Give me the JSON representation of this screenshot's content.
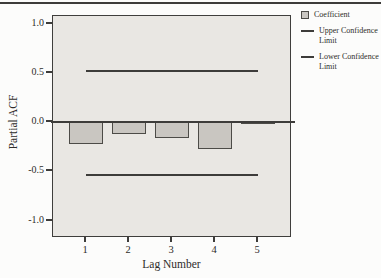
{
  "chart_data": {
    "type": "bar",
    "title": "",
    "xlabel": "Lag Number",
    "ylabel": "Partial ACF",
    "categories": [
      "1",
      "2",
      "3",
      "4",
      "5"
    ],
    "values": [
      -0.22,
      -0.12,
      -0.16,
      -0.27,
      0.0
    ],
    "series_name": "Coefficient",
    "yticks": [
      1.0,
      0.5,
      0.0,
      -0.5,
      -1.0
    ],
    "ytick_labels": [
      "1.0",
      "0.5",
      "0.0",
      "-0.5",
      "-1.0"
    ],
    "ylim": [
      -1.18,
      1.08
    ],
    "grid": false,
    "zero_reference_line": 0.0,
    "confidence_limits": {
      "upper": 0.52,
      "lower": -0.54
    },
    "legend": {
      "position": "top-right-outside",
      "items": [
        {
          "label": "Coefficient",
          "swatch": "square"
        },
        {
          "label": "Upper Confidence Limit",
          "swatch": "line"
        },
        {
          "label": "Lower Confidence Limit",
          "swatch": "line"
        }
      ]
    },
    "colors": {
      "bar_fill": "#c9c6c1",
      "bar_border": "#4c4b47",
      "plot_background": "#e9e7e3",
      "line": "#3d3c3a",
      "text": "#2e2c2a"
    }
  }
}
